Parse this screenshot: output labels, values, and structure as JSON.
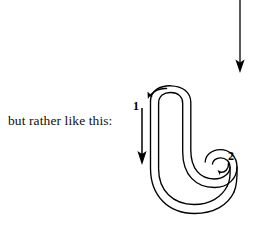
{
  "figure": {
    "caption": "but rather like this:",
    "background_color": "#ffffff",
    "ink_color": "#000000",
    "stroke_labels": [
      {
        "id": "1",
        "text": "1"
      },
      {
        "id": "2",
        "text": "2"
      }
    ],
    "elements": {
      "top_arrow": {
        "name": "downward-arrow",
        "direction": "down"
      },
      "hook_outline": {
        "name": "j-hook-outline",
        "description": "ribbon outline of a J shaped hook with curled tip"
      },
      "stroke_one_arrow": {
        "name": "stroke-1-down-arrow",
        "direction": "down"
      },
      "stroke_one_curl_arrow": {
        "name": "stroke-1-curl-arrow",
        "direction": "left"
      },
      "stroke_two_arrow": {
        "name": "stroke-2-curl-arrow",
        "direction": "down-left"
      }
    }
  }
}
